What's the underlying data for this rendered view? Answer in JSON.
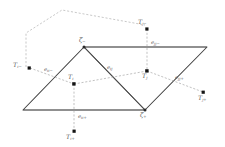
{
  "figure": {
    "type": "diagram",
    "colors": {
      "mesh_dark": "#4a4a4a",
      "mesh_grey": "#9a9a9a",
      "dashed": "#a8a8a8",
      "node_fill": "#1a1a1a",
      "label_text": "#5b5b5b",
      "background": "#ffffff"
    }
  },
  "nodes": [
    {
      "id": "Ti",
      "base": "T",
      "sub": "i",
      "sup": "",
      "label": "T i",
      "x": 74,
      "y": 84
    },
    {
      "id": "Tj",
      "base": "T",
      "sub": "j",
      "sup": "",
      "label": "T j",
      "x": 147,
      "y": 71
    },
    {
      "id": "Ti-",
      "base": "T",
      "sub": "i",
      "sup": "-",
      "label": "T i-",
      "x": 26,
      "y": 67
    },
    {
      "id": "Tj-",
      "base": "T",
      "sub": "j",
      "sup": "-",
      "label": "T j-",
      "x": 145,
      "y": 25
    },
    {
      "id": "Ti+",
      "base": "T",
      "sub": "i",
      "sup": "+",
      "label": "T i+",
      "x": 74,
      "y": 135
    },
    {
      "id": "Tj+",
      "base": "T",
      "sub": "j",
      "sup": "+",
      "label": "T j+",
      "x": 206,
      "y": 93
    }
  ],
  "node_labels": {
    "Ti": {
      "base": "T",
      "sub": "i"
    },
    "Tj": {
      "base": "T",
      "sub": "j"
    },
    "Ti_minus": {
      "base": "T",
      "sub": "i−"
    },
    "Tj_minus": {
      "base": "T",
      "sub": "j−"
    },
    "Ti_plus": {
      "base": "T",
      "sub": "i+"
    },
    "Tj_plus": {
      "base": "T",
      "sub": "j+"
    }
  },
  "edge_labels": {
    "e_ii_minus": {
      "base": "e",
      "sub": "ii−"
    },
    "e_ij": {
      "base": "e",
      "sub": "ij"
    },
    "e_jj_minus": {
      "base": "e",
      "sub": "jj−"
    },
    "e_jj_plus": {
      "base": "e",
      "sub": "jj+"
    },
    "e_ii_plus": {
      "base": "e",
      "sub": "ii+"
    }
  },
  "vertex_labels": {
    "zeta_minus": {
      "base": "ζ",
      "sub": "−"
    },
    "zeta_plus": {
      "base": "ζ",
      "sub": "+"
    }
  },
  "geometry": {
    "zeta_minus_point": {
      "x": 84,
      "y": 47
    },
    "zeta_plus_point": {
      "x": 145,
      "y": 110
    },
    "mesh_left_bottom": {
      "x": 23,
      "y": 110
    },
    "mesh_right_top": {
      "x": 207,
      "y": 47
    }
  }
}
